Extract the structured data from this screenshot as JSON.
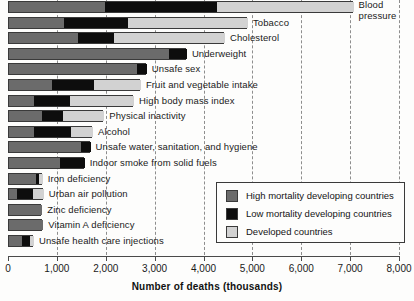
{
  "chart_data": {
    "type": "bar",
    "orientation": "horizontal",
    "stacked": true,
    "title": "",
    "xlabel": "Number of deaths (thousands)",
    "ylabel": "",
    "xlim": [
      0,
      8000
    ],
    "xticks": [
      0,
      1000,
      2000,
      3000,
      4000,
      5000,
      6000,
      7000,
      8000
    ],
    "xtick_labels": [
      "0",
      "1,000",
      "2,000",
      "3,000",
      "4,000",
      "5,000",
      "6,000",
      "7,000",
      "8,000"
    ],
    "grid": "vertical-dashed",
    "legend_position": "lower-right",
    "series": [
      {
        "name": "High mortality developing countries",
        "color": "#6b6b6b",
        "values": [
          1960,
          1130,
          1410,
          3270,
          2620,
          880,
          510,
          680,
          510,
          1470,
          1040,
          550,
          160,
          680,
          700,
          270
        ]
      },
      {
        "name": "Low mortality developing countries",
        "color": "#0d0d0d",
        "values": [
          2290,
          1310,
          740,
          370,
          200,
          860,
          740,
          430,
          760,
          200,
          510,
          60,
          330,
          0,
          0,
          160
        ]
      },
      {
        "name": "Developed countries",
        "color": "#d2d2d2",
        "values": [
          2800,
          2450,
          2270,
          0,
          0,
          960,
          1310,
          840,
          450,
          0,
          0,
          80,
          220,
          0,
          0,
          80
        ]
      }
    ],
    "categories": [
      "Blood pressure",
      "Tobacco",
      "Cholesterol",
      "Underweight",
      "Unsafe sex",
      "Fruit and vegetable intake",
      "High body mass index",
      "Physical inactivity",
      "Alcohol",
      "Unsafe water, sanitation, and hygiene",
      "Indoor smoke from solid fuels",
      "Iron deficiency",
      "Urban air pollution",
      "Zinc deficiency",
      "Vitamin A deficiency",
      "Unsafe health care injections"
    ],
    "totals": [
      7050,
      4890,
      4420,
      3640,
      2820,
      2700,
      2560,
      1950,
      1720,
      1670,
      1550,
      690,
      710,
      680,
      700,
      510
    ]
  },
  "legend": {
    "items": [
      {
        "label": "High mortality developing countries",
        "color": "#6b6b6b"
      },
      {
        "label": "Low mortality developing countries",
        "color": "#0d0d0d"
      },
      {
        "label": "Developed countries",
        "color": "#d2d2d2"
      }
    ]
  },
  "axis": {
    "xlabel": "Number of deaths (thousands)"
  }
}
